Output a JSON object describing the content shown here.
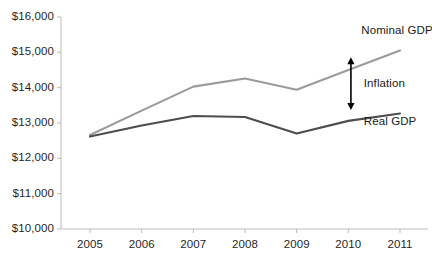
{
  "chart_data": {
    "type": "line",
    "title": "",
    "subtitle": "",
    "xlabel": "",
    "ylabel": "",
    "x": [
      2005,
      2006,
      2007,
      2008,
      2009,
      2010,
      2011
    ],
    "xtick_labels": [
      "2005",
      "2006",
      "2007",
      "2008",
      "2009",
      "2010",
      "2011"
    ],
    "ytick_labels": [
      "$16,000",
      "$15,000",
      "$14,000",
      "$13,000",
      "$12,000",
      "$11,000",
      "$10,000"
    ],
    "ytick_values": [
      16000,
      15000,
      14000,
      13000,
      12000,
      11000,
      10000
    ],
    "ylim": [
      10000,
      16000
    ],
    "xlim": [
      2005,
      2011
    ],
    "grid": false,
    "legend": "none",
    "series": [
      {
        "name": "Nominal GDP",
        "color": "#9b9b9b",
        "values": [
          12660,
          13350,
          14030,
          14260,
          13940,
          14500,
          15050
        ]
      },
      {
        "name": "Real GDP",
        "color": "#4d4d4d",
        "values": [
          12620,
          12930,
          13200,
          13170,
          12700,
          13060,
          13270
        ]
      }
    ],
    "annotations": [
      {
        "text": "Nominal GDP",
        "x": 2010.25,
        "y": 15600
      },
      {
        "text": "Inflation",
        "x": 2010.3,
        "y": 14100
      },
      {
        "text": "Real GDP",
        "x": 2010.3,
        "y": 13020
      }
    ],
    "arrow": {
      "name": "inflation-double-arrow",
      "x": 2010.05,
      "y_top": 14860,
      "y_bottom": 13370,
      "color": "#000000"
    }
  },
  "axis": {
    "line_color": "#bfbfbf",
    "tick_color": "#bfbfbf"
  }
}
